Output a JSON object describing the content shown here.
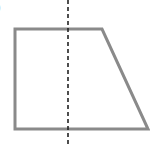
{
  "diagram": {
    "type": "trapezoid-with-symmetry-line",
    "label_fragment": ")",
    "shape": {
      "name": "trapezoid",
      "points": [
        [
          15,
          29
        ],
        [
          102,
          29
        ],
        [
          148,
          129
        ],
        [
          15,
          129
        ]
      ],
      "stroke": "#8a8a8a",
      "stroke_width": 3
    },
    "dashed_line": {
      "x": 68,
      "y1": 0,
      "y2": 144,
      "stroke": "#222222",
      "dash": "4,3"
    }
  }
}
